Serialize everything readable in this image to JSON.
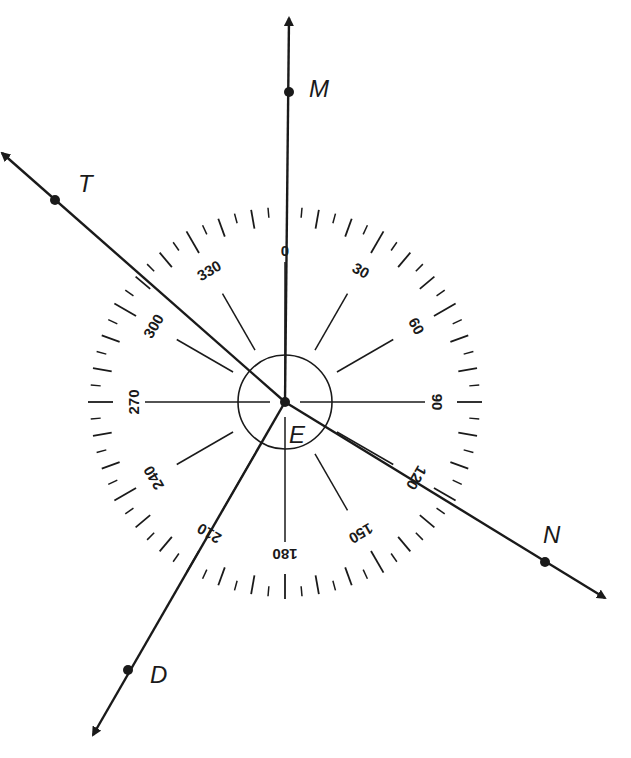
{
  "diagram": {
    "type": "protractor-compass with rays",
    "vertex": {
      "label": "E"
    },
    "dial": {
      "degree_labels": [
        "0",
        "30",
        "60",
        "90",
        "120",
        "150",
        "180",
        "210",
        "240",
        "270",
        "300",
        "330"
      ],
      "major_tick_every_deg": 10,
      "minor_tick_every_deg": 5,
      "spoke_every_deg": 30
    },
    "rays": [
      {
        "id": "M",
        "label": "M",
        "bearing_deg": 0
      },
      {
        "id": "N",
        "label": "N",
        "bearing_deg": 120
      },
      {
        "id": "D",
        "label": "D",
        "bearing_deg": 210
      },
      {
        "id": "T",
        "label": "T",
        "bearing_deg": 300
      }
    ]
  },
  "colors": {
    "ink": "#1a1a1a",
    "background": "#ffffff"
  }
}
